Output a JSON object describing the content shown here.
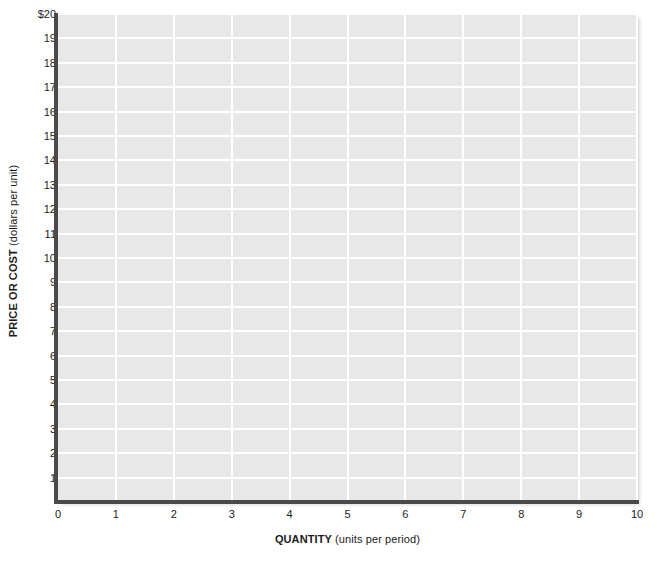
{
  "chart_data": {
    "type": "line",
    "title": "",
    "subtitle": "",
    "xlabel_bold": "QUANTITY",
    "xlabel_rest": "(units per period)",
    "ylabel_bold": "PRICE OR COST",
    "ylabel_rest": "(dollars per unit)",
    "xlim": [
      0,
      10
    ],
    "ylim": [
      0,
      20
    ],
    "x_ticks": [
      0,
      1,
      2,
      3,
      4,
      5,
      6,
      7,
      8,
      9,
      10
    ],
    "x_tick_labels": [
      "0",
      "1",
      "2",
      "3",
      "4",
      "5",
      "6",
      "7",
      "8",
      "9",
      "10"
    ],
    "y_ticks": [
      1,
      2,
      3,
      4,
      5,
      6,
      7,
      8,
      9,
      10,
      11,
      12,
      13,
      14,
      15,
      16,
      17,
      18,
      19,
      20
    ],
    "y_tick_labels": [
      "1",
      "2",
      "3",
      "4",
      "5",
      "6",
      "7",
      "8",
      "9",
      "10",
      "11",
      "12",
      "13",
      "14",
      "15",
      "16",
      "17",
      "18",
      "19",
      "$20"
    ],
    "grid": true,
    "grid_color": "#ffffff",
    "plot_background": "#e8e8e8",
    "axis_color": "#4a4a4a",
    "legend": [],
    "series": [],
    "annotations": []
  },
  "colors": {
    "page_background": "#ffffff",
    "plot_background": "#e8e8e8",
    "gridline": "#ffffff",
    "axis": "#4a4a4a",
    "text": "#1b1b1b"
  }
}
